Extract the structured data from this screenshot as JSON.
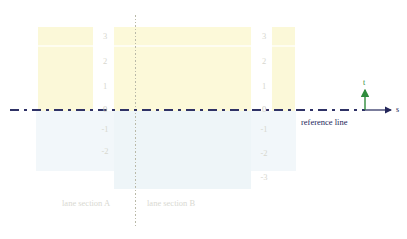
{
  "diagram": {
    "background_color": "#ffffff",
    "width": 407,
    "height": 239
  },
  "reference_line": {
    "label": "reference line",
    "color": "#2f3266",
    "style": "dash-dot"
  },
  "axes": {
    "s_label": "s",
    "t_label": "t",
    "s_color": "#23265a",
    "t_color": "#2f8c3c"
  },
  "divider": {
    "style": "dotted",
    "color": "#b9b9a8"
  },
  "lane_sections": [
    {
      "label": "lane section A"
    },
    {
      "label": "lane section B"
    }
  ],
  "tick_labels_left": [
    "3",
    "2",
    "1",
    "0",
    "-1",
    "-2"
  ],
  "tick_labels_right": [
    "3",
    "2",
    "1",
    "0",
    "-1",
    "-2",
    "-3"
  ],
  "colors": {
    "lane_band": "#fbf8d8",
    "lane_band_mid": "#fcf9d9",
    "lower_tint": "#f2f7fa",
    "tick_text": "#d7d7cf",
    "section_text": "#d9d9d2"
  }
}
